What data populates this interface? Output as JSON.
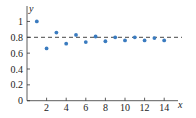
{
  "chart_data": {
    "type": "scatter",
    "title": "",
    "xlabel": "x",
    "ylabel": "y",
    "xlim": [
      0,
      15
    ],
    "ylim": [
      0,
      1.15
    ],
    "x_ticks": [
      2,
      4,
      6,
      8,
      10,
      12,
      14
    ],
    "y_ticks": [
      0,
      0.2,
      0.4,
      0.6,
      0.8,
      1
    ],
    "x_tick_labels": [
      "2",
      "4",
      "6",
      "8",
      "10",
      "12",
      "14"
    ],
    "y_tick_labels": [
      "0",
      "0.2",
      "0.4",
      "0.6",
      "0.8",
      "1"
    ],
    "grid": false,
    "series": [
      {
        "name": "sequence",
        "x": [
          1,
          2,
          3,
          4,
          5,
          6,
          7,
          8,
          9,
          10,
          11,
          12,
          13,
          14
        ],
        "values": [
          1.0,
          0.66,
          0.86,
          0.72,
          0.83,
          0.74,
          0.81,
          0.75,
          0.8,
          0.76,
          0.8,
          0.76,
          0.79,
          0.76
        ],
        "color": "#3a7bbf"
      }
    ],
    "reference_lines": [
      {
        "orientation": "horizontal",
        "y": 0.8,
        "style": "dashed",
        "color": "#333333"
      }
    ]
  }
}
